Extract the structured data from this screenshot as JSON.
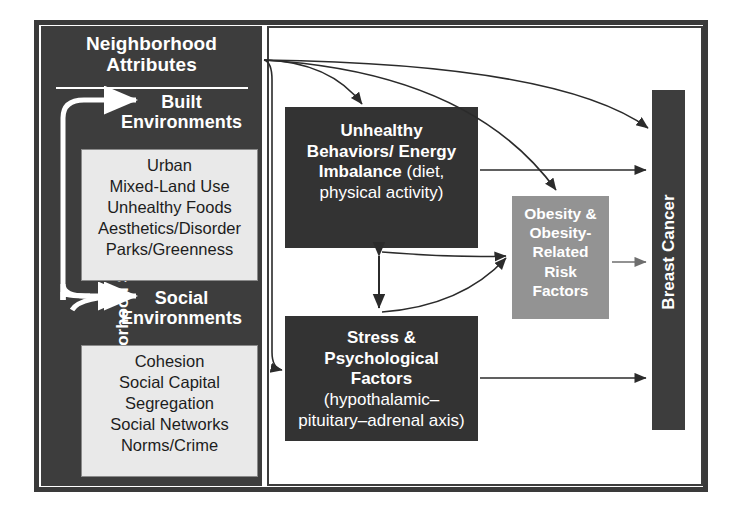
{
  "figure": {
    "colors": {
      "panel_dark": "#3d3d3d",
      "box_dark": "#333333",
      "box_gray": "#939393",
      "list_fill": "#e9e9e9",
      "frame": "#3a3a3a",
      "text_light": "#ffffff",
      "text_dark": "#1d1d1d"
    }
  },
  "ses_panel": {
    "axis_label": "Neighborhood SES",
    "attributes_title": "Neighborhood\nAttributes",
    "attributes_title_line1": "Neighborhood",
    "attributes_title_line2": "Attributes",
    "built": {
      "title_line1": "Built",
      "title_line2": "Environments",
      "items": [
        "Urban",
        "Mixed-Land Use",
        "Unhealthy  Foods",
        "Aesthetics/Disorder",
        "Parks/Greenness"
      ]
    },
    "social": {
      "title_line1": "Social",
      "title_line2": "Environments",
      "items": [
        "Cohesion",
        "Social Capital",
        "Segregation",
        "Social Networks",
        "Norms/Crime"
      ]
    }
  },
  "mediators": {
    "behaviors": {
      "bold_line1": "Unhealthy",
      "bold_line2": "Behaviors/ Energy",
      "bold_line3": "Imbalance",
      "plain_inline": " (diet,",
      "plain_line2": "physical activity)"
    },
    "stress": {
      "bold_line1": "Stress &",
      "bold_line2": "Psychological",
      "bold_line3": "Factors",
      "plain_line1": "(hypothalamic–",
      "plain_line2": "pituitary–adrenal axis)"
    },
    "obesity": {
      "line1": "Obesity &",
      "line2": "Obesity-",
      "line3": "Related",
      "line4": "Risk",
      "line5": "Factors"
    }
  },
  "outcome": {
    "label": "Breast Cancer"
  },
  "edges": [
    {
      "from": "Neighborhood Attributes",
      "to": "Unhealthy Behaviors/ Energy Imbalance",
      "style": "curved"
    },
    {
      "from": "Neighborhood Attributes",
      "to": "Obesity & Obesity-Related Risk Factors",
      "style": "curved"
    },
    {
      "from": "Neighborhood Attributes",
      "to": "Breast Cancer",
      "style": "curved"
    },
    {
      "from": "Neighborhood Attributes",
      "to": "Stress & Psychological Factors",
      "style": "curved"
    },
    {
      "from": "Unhealthy Behaviors/ Energy Imbalance",
      "to": "Obesity & Obesity-Related Risk Factors",
      "style": "curved"
    },
    {
      "from": "Stress & Psychological Factors",
      "to": "Obesity & Obesity-Related Risk Factors",
      "style": "curved"
    },
    {
      "from": "Unhealthy Behaviors/ Energy Imbalance",
      "to": "Stress & Psychological Factors",
      "style": "double-headed"
    },
    {
      "from": "Unhealthy Behaviors/ Energy Imbalance",
      "to": "Breast Cancer",
      "style": "straight"
    },
    {
      "from": "Obesity & Obesity-Related Risk Factors",
      "to": "Breast Cancer",
      "style": "straight"
    },
    {
      "from": "Stress & Psychological Factors",
      "to": "Breast Cancer",
      "style": "straight"
    },
    {
      "from": "Neighborhood SES",
      "to": "Built Environments",
      "style": "white-curved"
    },
    {
      "from": "Neighborhood SES",
      "to": "Social Environments",
      "style": "white-curved"
    }
  ]
}
